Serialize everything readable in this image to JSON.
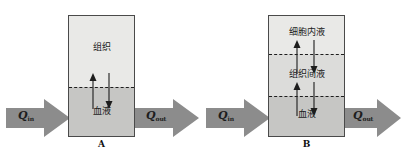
{
  "figure": {
    "background_color": "#ffffff",
    "box_border_color": "#4a4a4a",
    "dashed_line_color": "#1d1d1d",
    "arrow_fill_color": "#8c8c8c",
    "compartment_light_color": "#e9e9e7",
    "compartment_mid_color": "#dcdcda",
    "compartment_dark_color": "#c6c6c4"
  },
  "panels": [
    {
      "caption": "A",
      "compartments": [
        {
          "label": "组织",
          "meaning": "tissue",
          "shade": "light"
        },
        {
          "label": "血液",
          "meaning": "blood",
          "shade": "dark"
        }
      ],
      "flow_in": {
        "symbol": "Q",
        "subscript": "in"
      },
      "flow_out": {
        "symbol": "Q",
        "subscript": "out"
      },
      "exchange_arrow_pairs": 1
    },
    {
      "caption": "B",
      "compartments": [
        {
          "label": "细胞内液",
          "meaning": "intracellular fluid",
          "shade": "light"
        },
        {
          "label": "组织间液",
          "meaning": "interstitial fluid",
          "shade": "mid"
        },
        {
          "label": "血液",
          "meaning": "blood",
          "shade": "dark"
        }
      ],
      "flow_in": {
        "symbol": "Q",
        "subscript": "in"
      },
      "flow_out": {
        "symbol": "Q",
        "subscript": "out"
      },
      "exchange_arrow_pairs": 2
    }
  ]
}
